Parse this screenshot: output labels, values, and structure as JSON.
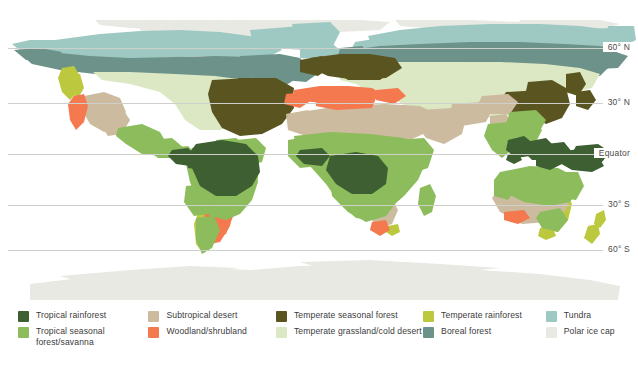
{
  "map": {
    "title": "World biomes map",
    "latitude_labels": [
      {
        "name": "60-n",
        "text": "60° N",
        "y": 42
      },
      {
        "name": "30-n",
        "text": "30° N",
        "y": 97
      },
      {
        "name": "equator",
        "text": "Equator",
        "y": 148
      },
      {
        "name": "30-s",
        "text": "30° S",
        "y": 199
      },
      {
        "name": "60-s",
        "text": "60° S",
        "y": 244
      }
    ],
    "gridlines_y": [
      48,
      103,
      154,
      205,
      250
    ]
  },
  "colors": {
    "tropical_rainforest": "#3d5f31",
    "tropical_seasonal_forest_savanna": "#8cbc5c",
    "subtropical_desert": "#cdbb9f",
    "woodland_shrubland": "#f4794f",
    "temperate_seasonal_forest": "#5a5520",
    "temperate_grassland_cold_desert": "#dce8c4",
    "temperate_rainforest": "#bcc93f",
    "boreal_forest": "#6d9289",
    "tundra": "#9ec9c3",
    "polar_ice_cap": "#e9e9e3",
    "ocean": "#ffffff",
    "gridline": "#cfcfcb",
    "text": "#3b3b3b"
  },
  "legend": {
    "columns": [
      {
        "name": "legend-column-1",
        "items": [
          {
            "label": "Tropical rainforest",
            "color_key": "tropical_rainforest",
            "swatch": "#3d5f31"
          },
          {
            "label": "Tropical seasonal forest/savanna",
            "color_key": "tropical_seasonal_forest_savanna",
            "swatch": "#8cbc5c"
          }
        ]
      },
      {
        "name": "legend-column-2",
        "items": [
          {
            "label": "Subtropical desert",
            "color_key": "subtropical_desert",
            "swatch": "#cdbb9f"
          },
          {
            "label": "Woodland/shrubland",
            "color_key": "woodland_shrubland",
            "swatch": "#f4794f"
          }
        ]
      },
      {
        "name": "legend-column-3",
        "items": [
          {
            "label": "Temperate seasonal forest",
            "color_key": "temperate_seasonal_forest",
            "swatch": "#5a5520"
          },
          {
            "label": "Temperate grassland/cold desert",
            "color_key": "temperate_grassland_cold_desert",
            "swatch": "#dce8c4"
          }
        ]
      },
      {
        "name": "legend-column-4",
        "items": [
          {
            "label": "Temperate rainforest",
            "color_key": "temperate_rainforest",
            "swatch": "#bcc93f"
          },
          {
            "label": "Boreal forest",
            "color_key": "boreal_forest",
            "swatch": "#6d9289"
          }
        ]
      },
      {
        "name": "legend-column-5",
        "items": [
          {
            "label": "Tundra",
            "color_key": "tundra",
            "swatch": "#9ec9c3"
          },
          {
            "label": "Polar ice cap",
            "color_key": "polar_ice_cap",
            "swatch": "#e9e9e3"
          }
        ]
      }
    ]
  }
}
